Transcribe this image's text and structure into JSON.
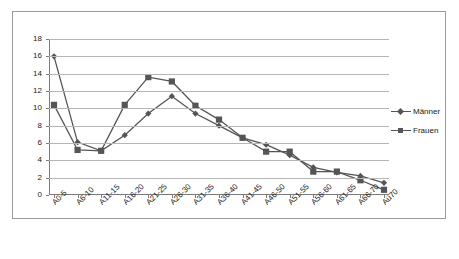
{
  "chart_data": {
    "type": "line",
    "title": "",
    "xlabel": "",
    "ylabel": "",
    "ylim": [
      0,
      18
    ],
    "ytick_step": 2,
    "yticks": [
      0,
      2,
      4,
      6,
      8,
      10,
      12,
      14,
      16,
      18
    ],
    "grid": true,
    "legend_position": "right",
    "categories": [
      "A0-5",
      "A6-10",
      "A11-15",
      "A16-20",
      "A21-25",
      "A26-30",
      "A31-35",
      "A36-40",
      "A41-45",
      "A46-50",
      "A51-55",
      "A56-60",
      "A61-65",
      "A66-70",
      "Aü70"
    ],
    "series": [
      {
        "name": "Männer",
        "marker": "diamond",
        "color": "#555555",
        "values": [
          16.0,
          6.1,
          5.1,
          6.9,
          9.4,
          11.4,
          9.4,
          8.0,
          6.6,
          5.8,
          4.6,
          3.2,
          2.6,
          2.2,
          1.4
        ]
      },
      {
        "name": "Frauen",
        "marker": "square",
        "color": "#555555",
        "values": [
          10.4,
          5.2,
          5.1,
          10.4,
          13.6,
          13.1,
          10.3,
          8.7,
          6.6,
          5.0,
          5.0,
          2.7,
          2.7,
          1.7,
          0.6
        ]
      }
    ]
  },
  "colors": {
    "line": "#555555",
    "grid": "#b6b6b6",
    "axis": "#7a7a7a",
    "border": "#9a9a9a",
    "text": "#1a1a1a",
    "background": "#ffffff"
  }
}
